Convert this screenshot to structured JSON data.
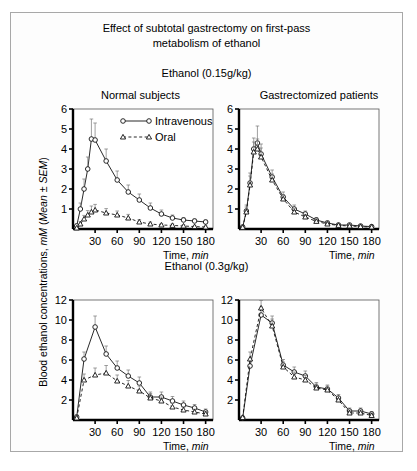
{
  "figure": {
    "title_line1": "Effect of subtotal gastrectomy on first-pass",
    "title_line2": "metabolism of ethanol",
    "y_axis_label_plain": "Blood ethanol concentrations, ",
    "y_axis_label_italic1": "mM",
    "y_axis_label_mid": " (",
    "y_axis_label_italic2": "Mean ± SEM",
    "y_axis_label_end": ")",
    "x_axis_label_plain": "Time, ",
    "x_axis_label_italic": "min",
    "dose_top": "Ethanol (0.15g/kg)",
    "dose_bottom": "Ethanol (0.3g/kg)",
    "panel_title_left": "Normal subjects",
    "panel_title_right": "Gastrectomized patients",
    "legend": {
      "intravenous": "Intravenous",
      "oral": "Oral"
    },
    "colors": {
      "axis": "#000000",
      "frame": "#a8a8a8",
      "background": "#fdfdfd",
      "marker_fill": "#ffffff",
      "line": "#1a1a1a"
    }
  },
  "chart_data": [
    {
      "id": "top-left",
      "type": "line",
      "title": "Normal subjects",
      "subtitle": "Ethanol (0.15g/kg)",
      "xlabel": "Time, min",
      "ylabel": "Blood ethanol concentrations, mM (Mean ± SEM)",
      "xlim": [
        0,
        190
      ],
      "ylim": [
        0,
        6
      ],
      "xticks": [
        30,
        60,
        90,
        120,
        150,
        180
      ],
      "yticks": [
        1,
        2,
        3,
        4,
        5,
        6
      ],
      "grid": false,
      "legend_position": "top-right",
      "series": [
        {
          "name": "Intravenous",
          "marker": "circle",
          "linestyle": "solid",
          "x": [
            5,
            10,
            15,
            20,
            25,
            30,
            45,
            60,
            75,
            90,
            105,
            120,
            135,
            150,
            165,
            180
          ],
          "y": [
            0.15,
            1.0,
            2.0,
            3.0,
            4.5,
            4.45,
            3.4,
            2.45,
            1.85,
            1.45,
            1.05,
            0.75,
            0.55,
            0.45,
            0.4,
            0.35
          ],
          "err": [
            0.1,
            0.3,
            0.5,
            0.6,
            1.0,
            0.85,
            0.6,
            0.45,
            0.35,
            0.3,
            0.25,
            0.2,
            0.15,
            0.12,
            0.1,
            0.1
          ]
        },
        {
          "name": "Oral",
          "marker": "triangle",
          "linestyle": "dashed",
          "x": [
            5,
            10,
            15,
            20,
            25,
            30,
            45,
            60,
            75,
            90,
            105,
            120,
            135,
            150,
            165,
            180
          ],
          "y": [
            0.05,
            0.25,
            0.5,
            0.7,
            0.85,
            0.95,
            0.8,
            0.7,
            0.55,
            0.35,
            0.25,
            0.2,
            0.18,
            0.15,
            0.12,
            0.1
          ],
          "err": [
            0.05,
            0.12,
            0.18,
            0.22,
            0.3,
            0.28,
            0.22,
            0.2,
            0.18,
            0.12,
            0.1,
            0.08,
            0.07,
            0.06,
            0.05,
            0.05
          ]
        }
      ]
    },
    {
      "id": "top-right",
      "type": "line",
      "title": "Gastrectomized patients",
      "subtitle": "Ethanol (0.15g/kg)",
      "xlabel": "Time, min",
      "ylabel": "Blood ethanol concentrations, mM (Mean ± SEM)",
      "xlim": [
        0,
        190
      ],
      "ylim": [
        0,
        6
      ],
      "xticks": [
        30,
        60,
        90,
        120,
        150,
        180
      ],
      "yticks": [
        1,
        2,
        3,
        4,
        5,
        6
      ],
      "grid": false,
      "legend_position": "none",
      "series": [
        {
          "name": "Intravenous",
          "marker": "circle",
          "linestyle": "solid",
          "x": [
            5,
            10,
            15,
            20,
            25,
            30,
            45,
            60,
            75,
            90,
            105,
            120,
            135,
            150,
            165,
            180
          ],
          "y": [
            0.1,
            0.9,
            2.3,
            4.0,
            4.3,
            3.75,
            2.6,
            1.6,
            1.0,
            0.75,
            0.45,
            0.3,
            0.2,
            0.2,
            0.15,
            0.12
          ],
          "err": [
            0.08,
            0.3,
            0.5,
            0.55,
            0.85,
            0.5,
            0.35,
            0.25,
            0.2,
            0.15,
            0.12,
            0.1,
            0.08,
            0.08,
            0.06,
            0.05
          ]
        },
        {
          "name": "Oral",
          "marker": "triangle",
          "linestyle": "dashed",
          "x": [
            5,
            10,
            15,
            20,
            25,
            30,
            45,
            60,
            75,
            90,
            105,
            120,
            135,
            150,
            165,
            180
          ],
          "y": [
            0.08,
            0.85,
            2.2,
            3.85,
            4.0,
            3.6,
            2.45,
            1.5,
            0.85,
            0.6,
            0.38,
            0.25,
            0.18,
            0.15,
            0.12,
            0.1
          ],
          "err": [
            0.06,
            0.25,
            0.45,
            0.5,
            0.5,
            0.45,
            0.3,
            0.22,
            0.18,
            0.13,
            0.1,
            0.08,
            0.07,
            0.06,
            0.05,
            0.05
          ]
        }
      ]
    },
    {
      "id": "bottom-left",
      "type": "line",
      "title": "Normal subjects",
      "subtitle": "Ethanol (0.3g/kg)",
      "xlabel": "Time, min",
      "ylabel": "Blood ethanol concentrations, mM (Mean ± SEM)",
      "xlim": [
        0,
        190
      ],
      "ylim": [
        0,
        12
      ],
      "xticks": [
        30,
        60,
        90,
        120,
        150,
        180
      ],
      "yticks": [
        2,
        4,
        6,
        8,
        10,
        12
      ],
      "grid": false,
      "legend_position": "none",
      "series": [
        {
          "name": "Intravenous",
          "marker": "circle",
          "linestyle": "solid",
          "x": [
            5,
            15,
            30,
            45,
            60,
            75,
            90,
            105,
            120,
            135,
            150,
            165,
            180
          ],
          "y": [
            0.3,
            6.1,
            9.3,
            6.6,
            5.2,
            4.4,
            3.7,
            2.3,
            2.3,
            1.9,
            1.5,
            1.2,
            0.8
          ],
          "err": [
            0.2,
            0.7,
            1.1,
            0.8,
            0.7,
            0.6,
            0.6,
            0.5,
            0.5,
            0.45,
            0.4,
            0.35,
            0.3
          ]
        },
        {
          "name": "Oral",
          "marker": "triangle",
          "linestyle": "dashed",
          "x": [
            5,
            15,
            30,
            45,
            60,
            75,
            90,
            105,
            120,
            135,
            150,
            165,
            180
          ],
          "y": [
            0.2,
            4.0,
            4.5,
            4.7,
            3.9,
            3.4,
            2.9,
            2.2,
            1.9,
            1.3,
            1.0,
            0.8,
            0.6
          ],
          "err": [
            0.15,
            0.6,
            0.7,
            0.75,
            0.6,
            0.55,
            0.5,
            0.45,
            0.4,
            0.35,
            0.3,
            0.28,
            0.25
          ]
        }
      ]
    },
    {
      "id": "bottom-right",
      "type": "line",
      "title": "Gastrectomized patients",
      "subtitle": "Ethanol (0.3g/kg)",
      "xlabel": "Time, min",
      "ylabel": "Blood ethanol concentrations, mM (Mean ± SEM)",
      "xlim": [
        0,
        190
      ],
      "ylim": [
        0,
        12
      ],
      "xticks": [
        30,
        60,
        90,
        120,
        150,
        180
      ],
      "yticks": [
        2,
        4,
        6,
        8,
        10,
        12
      ],
      "grid": false,
      "legend_position": "none",
      "series": [
        {
          "name": "Intravenous",
          "marker": "circle",
          "linestyle": "solid",
          "x": [
            5,
            15,
            30,
            45,
            60,
            75,
            90,
            105,
            120,
            135,
            150,
            165,
            180
          ],
          "y": [
            0.2,
            5.4,
            10.5,
            9.7,
            5.5,
            4.8,
            4.4,
            3.3,
            3.1,
            2.2,
            0.9,
            0.9,
            0.6
          ],
          "err": [
            0.15,
            0.6,
            0.8,
            0.7,
            0.55,
            0.5,
            0.5,
            0.45,
            0.4,
            0.35,
            0.3,
            0.3,
            0.25
          ]
        },
        {
          "name": "Oral",
          "marker": "triangle",
          "linestyle": "dashed",
          "x": [
            5,
            15,
            30,
            45,
            60,
            75,
            90,
            105,
            120,
            135,
            150,
            165,
            180
          ],
          "y": [
            0.25,
            6.1,
            11.2,
            9.4,
            5.3,
            4.3,
            4.0,
            3.2,
            3.0,
            2.0,
            0.7,
            0.7,
            0.45
          ],
          "err": [
            0.15,
            0.7,
            0.75,
            0.7,
            0.5,
            0.5,
            0.45,
            0.4,
            0.4,
            0.35,
            0.28,
            0.28,
            0.2
          ]
        }
      ]
    }
  ]
}
